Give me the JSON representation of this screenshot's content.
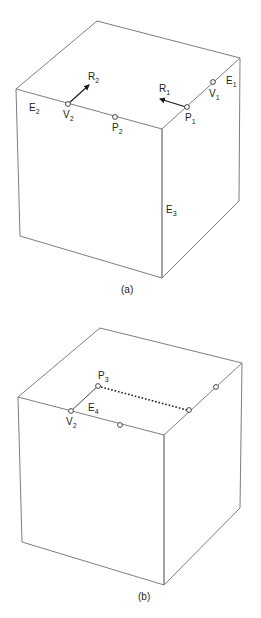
{
  "figure": {
    "panel_a": {
      "caption": "(a)",
      "labels": {
        "E1": {
          "base": "E",
          "sub": "1"
        },
        "E2": {
          "base": "E",
          "sub": "2"
        },
        "E3": {
          "base": "E",
          "sub": "3"
        },
        "V1": {
          "base": "V",
          "sub": "1"
        },
        "V2": {
          "base": "V",
          "sub": "2"
        },
        "P1": {
          "base": "P",
          "sub": "1"
        },
        "P2": {
          "base": "P",
          "sub": "2"
        },
        "R1": {
          "base": "R",
          "sub": "1"
        },
        "R2": {
          "base": "R",
          "sub": "2"
        }
      }
    },
    "panel_b": {
      "caption": "(b)",
      "labels": {
        "P3": {
          "base": "P",
          "sub": "3"
        },
        "E4": {
          "base": "E",
          "sub": "4"
        },
        "V2": {
          "base": "V",
          "sub": "2"
        }
      }
    },
    "colors": {
      "edge": "#6e6e6e",
      "marker": "#333333",
      "text": "#222222"
    }
  }
}
